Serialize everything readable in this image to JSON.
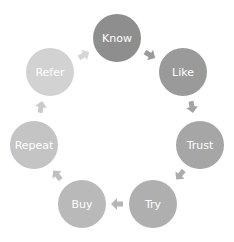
{
  "diagram": {
    "type": "cycle",
    "nodes": [
      {
        "id": "know",
        "label": "Know",
        "x": 117,
        "y": 38,
        "color": "#8e8e8e"
      },
      {
        "id": "like",
        "label": "Like",
        "x": 183,
        "y": 72,
        "color": "#9a9a9a"
      },
      {
        "id": "trust",
        "label": "Trust",
        "x": 200,
        "y": 145,
        "color": "#a6a6a6"
      },
      {
        "id": "try",
        "label": "Try",
        "x": 153,
        "y": 204,
        "color": "#afafaf"
      },
      {
        "id": "buy",
        "label": "Buy",
        "x": 82,
        "y": 204,
        "color": "#b9b9b9"
      },
      {
        "id": "repeat",
        "label": "Repeat",
        "x": 34,
        "y": 145,
        "color": "#c4c4c4"
      },
      {
        "id": "refer",
        "label": "Refer",
        "x": 50,
        "y": 72,
        "color": "#d2d2d2"
      }
    ],
    "arrows": [
      {
        "from": "know",
        "to": "like",
        "x": 150,
        "y": 55,
        "angle": 30,
        "color": "#9a9a9a"
      },
      {
        "from": "like",
        "to": "trust",
        "x": 192,
        "y": 107,
        "angle": 80,
        "color": "#a3a3a3"
      },
      {
        "from": "trust",
        "to": "try",
        "x": 180,
        "y": 175,
        "angle": 130,
        "color": "#acacac"
      },
      {
        "from": "try",
        "to": "buy",
        "x": 117,
        "y": 204,
        "angle": 180,
        "color": "#b5b5b5"
      },
      {
        "from": "buy",
        "to": "repeat",
        "x": 57,
        "y": 175,
        "angle": 230,
        "color": "#bfbfbf"
      },
      {
        "from": "repeat",
        "to": "refer",
        "x": 41,
        "y": 107,
        "angle": 280,
        "color": "#cacaca"
      },
      {
        "from": "refer",
        "to": "know",
        "x": 84,
        "y": 55,
        "angle": 330,
        "color": "#d6d6d6"
      }
    ]
  }
}
